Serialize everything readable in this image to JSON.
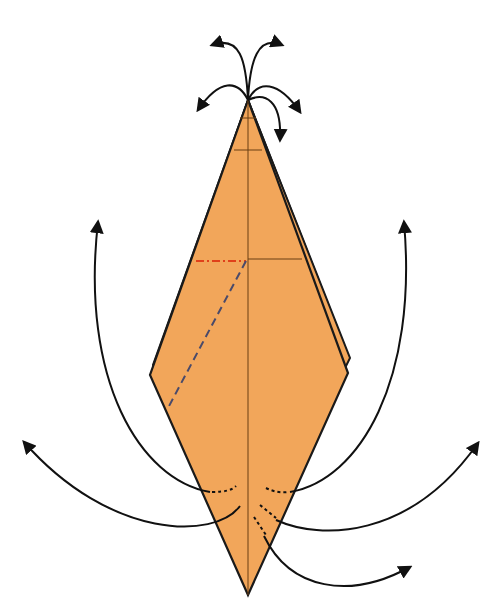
{
  "diagram": {
    "type": "origami-fold-diagram",
    "colors": {
      "paper": "#F2A65A",
      "paper_edge": "#E89A4E",
      "outline": "#1a1a1a",
      "crease": "#7a4a1a",
      "valley_fold": "#4a4a6a",
      "mountain_fold": "#E0401A",
      "arrow": "#111111"
    },
    "elements": {
      "top_arrows": 6,
      "side_arrows": 4,
      "bottom_arrow": 1,
      "fold_lines": [
        "mountain-fold-horizontal",
        "valley-fold-diagonal",
        "center-crease",
        "horizontal-crease"
      ]
    }
  }
}
